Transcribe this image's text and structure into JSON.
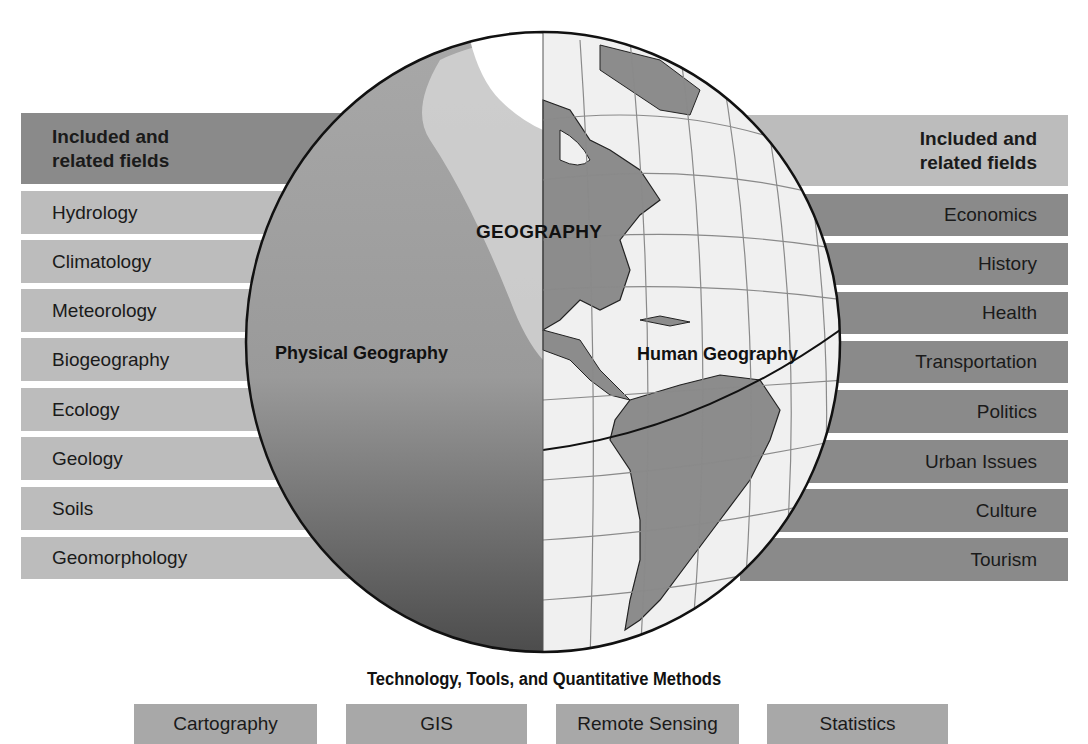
{
  "diagram": {
    "title": "GEOGRAPHY",
    "physical_label": "Physical Geography",
    "human_label": "Human Geography"
  },
  "left_panel": {
    "header": [
      "Included and",
      "related fields"
    ],
    "fields": [
      "Hydrology",
      "Climatology",
      "Meteorology",
      "Biogeography",
      "Ecology",
      "Geology",
      "Soils",
      "Geomorphology"
    ]
  },
  "right_panel": {
    "header": [
      "Included and",
      "related fields"
    ],
    "fields": [
      "Economics",
      "History",
      "Health",
      "Transportation",
      "Politics",
      "Urban Issues",
      "Culture",
      "Tourism"
    ]
  },
  "tools": {
    "title": "Technology, Tools, and Quantitative Methods",
    "items": [
      "Cartography",
      "GIS",
      "Remote Sensing",
      "Statistics"
    ]
  },
  "colors": {
    "left_header": "#8a8a8a",
    "left_rows": "#bcbcbc",
    "right_header": "#bcbcbc",
    "right_rows": "#8a8a8a",
    "tool_boxes": "#a8a8a8",
    "globe_physical": "#9a9a9a",
    "globe_land_human": "#8c8c8c",
    "globe_ocean_human": "#f0f0f0"
  }
}
